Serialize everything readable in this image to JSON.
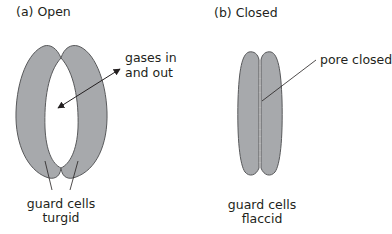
{
  "panels": [
    {
      "title": "(a) Open",
      "state": "open",
      "annotations": {
        "arrow_label_line1": "gases in",
        "arrow_label_line2": "and out",
        "cells_label_line1": "guard cells",
        "cells_label_line2": "turgid"
      }
    },
    {
      "title": "(b) Closed",
      "state": "closed",
      "annotations": {
        "pore_label": "pore closed",
        "cells_label_line1": "guard cells",
        "cells_label_line2": "flaccid"
      }
    }
  ],
  "colors": {
    "cell_fill": "#a7a9ac",
    "cell_stroke": "#58595b",
    "line": "#231f20",
    "text": "#231f20"
  }
}
